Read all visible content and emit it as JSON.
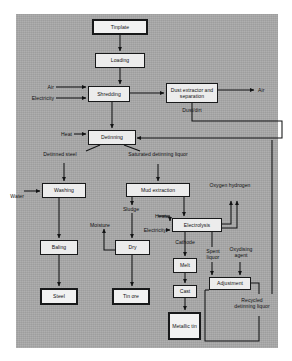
{
  "diagram": {
    "type": "process-flowchart",
    "panel_color": "#a8a8a8",
    "box_color": "#ececec",
    "line_color": "#121314",
    "nodes": [
      {
        "id": "tinplate",
        "label": "Tinplate",
        "x": 92,
        "y": 19,
        "w": 56,
        "h": 16,
        "emphasis": "thick"
      },
      {
        "id": "loading",
        "label": "Loading",
        "x": 95,
        "y": 53,
        "w": 50,
        "h": 15,
        "emphasis": "normal"
      },
      {
        "id": "shredding",
        "label": "Shredding",
        "x": 88,
        "y": 86,
        "w": 42,
        "h": 16,
        "emphasis": "normal"
      },
      {
        "id": "dust",
        "label": "Dust extractor and separation",
        "x": 166,
        "y": 83,
        "w": 52,
        "h": 20,
        "emphasis": "normal"
      },
      {
        "id": "detinning",
        "label": "Detinning",
        "x": 88,
        "y": 130,
        "w": 48,
        "h": 15,
        "emphasis": "normal"
      },
      {
        "id": "washing",
        "label": "Washing",
        "x": 42,
        "y": 183,
        "w": 44,
        "h": 15,
        "emphasis": "normal"
      },
      {
        "id": "mud",
        "label": "Mud extraction",
        "x": 126,
        "y": 183,
        "w": 64,
        "h": 14,
        "emphasis": "normal"
      },
      {
        "id": "electrolysis",
        "label": "Electrolysis",
        "x": 172,
        "y": 218,
        "w": 50,
        "h": 14,
        "emphasis": "normal"
      },
      {
        "id": "baling",
        "label": "Baling",
        "x": 40,
        "y": 240,
        "w": 38,
        "h": 15,
        "emphasis": "normal"
      },
      {
        "id": "dry",
        "label": "Dry",
        "x": 115,
        "y": 240,
        "w": 35,
        "h": 15,
        "emphasis": "normal"
      },
      {
        "id": "melt",
        "label": "Melt",
        "x": 173,
        "y": 258,
        "w": 24,
        "h": 15,
        "emphasis": "normal"
      },
      {
        "id": "adjustment",
        "label": "Adjustment",
        "x": 209,
        "y": 277,
        "w": 42,
        "h": 13,
        "emphasis": "normal"
      },
      {
        "id": "cast",
        "label": "Cast",
        "x": 173,
        "y": 285,
        "w": 24,
        "h": 13,
        "emphasis": "normal"
      },
      {
        "id": "steel",
        "label": "Steel",
        "x": 40,
        "y": 288,
        "w": 38,
        "h": 17,
        "emphasis": "thick"
      },
      {
        "id": "tinore",
        "label": "Tin ore",
        "x": 112,
        "y": 288,
        "w": 38,
        "h": 17,
        "emphasis": "thick"
      },
      {
        "id": "metallictin",
        "label": "Metallic tin",
        "x": 168,
        "y": 312,
        "w": 33,
        "h": 28,
        "emphasis": "thick"
      }
    ],
    "labels": [
      {
        "id": "air-in",
        "text": "Air",
        "x": 30,
        "y": 84,
        "w": 24,
        "align": "right"
      },
      {
        "id": "electricity-in",
        "text": "Electricity",
        "x": 22,
        "y": 95,
        "w": 32,
        "align": "right"
      },
      {
        "id": "air-out",
        "text": "Air",
        "x": 258,
        "y": 87,
        "w": 20,
        "align": "left"
      },
      {
        "id": "dust-dirt",
        "text": "Dust/dirt",
        "x": 174,
        "y": 108,
        "w": 36,
        "align": "center"
      },
      {
        "id": "heat-detinning",
        "text": "Heat",
        "x": 50,
        "y": 131,
        "w": 22,
        "align": "right"
      },
      {
        "id": "detinned-steel",
        "text": "Detinned steel",
        "x": 40,
        "y": 152,
        "w": 40,
        "align": "center"
      },
      {
        "id": "saturated-liq",
        "text": "Saturated detinning liquor",
        "x": 122,
        "y": 152,
        "w": 72,
        "align": "center"
      },
      {
        "id": "water-in",
        "text": "Water",
        "x": 16,
        "y": 193,
        "w": 24,
        "align": "right"
      },
      {
        "id": "oxygen-hydrogen",
        "text": "Oxygen hydrogen",
        "x": 208,
        "y": 183,
        "w": 44,
        "align": "center"
      },
      {
        "id": "sludge",
        "text": "Sludge",
        "x": 116,
        "y": 207,
        "w": 30,
        "align": "center"
      },
      {
        "id": "heat-electro",
        "text": "Heat",
        "x": 144,
        "y": 213,
        "w": 22,
        "align": "right"
      },
      {
        "id": "moisture",
        "text": "Moisture",
        "x": 84,
        "y": 222,
        "w": 32,
        "align": "center"
      },
      {
        "id": "electricity-el",
        "text": "Electricity",
        "x": 134,
        "y": 227,
        "w": 32,
        "align": "right"
      },
      {
        "id": "cathode",
        "text": "Cathode",
        "x": 168,
        "y": 240,
        "w": 34,
        "align": "center"
      },
      {
        "id": "spent-liquor",
        "text": "Spent liquor",
        "x": 203,
        "y": 253,
        "w": 24,
        "align": "center"
      },
      {
        "id": "oxydising",
        "text": "Oxydising agent",
        "x": 229,
        "y": 250,
        "w": 28,
        "align": "center"
      },
      {
        "id": "recycled-liq",
        "text": "Recycled detinning liquor",
        "x": 234,
        "y": 299,
        "w": 36,
        "align": "center"
      }
    ],
    "edges": [
      "tinplate->loading",
      "loading->shredding",
      "air->shredding",
      "electricity->shredding",
      "shredding->dust",
      "dust->air-out",
      "dust->dust-dirt",
      "shredding->detinning",
      "heat->detinning",
      "detinning->detinned-steel->washing",
      "detinning->saturated-liquor->mud-extraction",
      "water->washing",
      "washing->baling",
      "baling->steel",
      "mud->sludge->dry",
      "dry->moisture",
      "dry->tin-ore",
      "mud->electrolysis",
      "heat->electrolysis",
      "electricity->electrolysis",
      "electrolysis->oxygen-hydrogen",
      "electrolysis->cathode->melt",
      "melt->cast",
      "cast->metallic-tin",
      "electrolysis->spent-liquor->adjustment",
      "oxydising-agent->adjustment",
      "adjustment->recycled-detinning-liquor->detinning"
    ]
  }
}
